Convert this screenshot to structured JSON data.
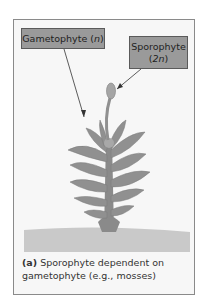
{
  "figure": {
    "labels": {
      "gametophyte": {
        "name": "Gametophyte",
        "ploidy": "n"
      },
      "sporophyte": {
        "name": "Sporophyte",
        "ploidy": "2n"
      }
    },
    "caption": {
      "tag": "(a)",
      "text": "Sporophyte dependent on gametophyte (e.g., mosses)"
    },
    "colors": {
      "label_fill": "#9a9a9a",
      "plant": "#8c8c8c",
      "ground": "#c8c8c8",
      "frame_border": "#8a8a8a"
    }
  }
}
